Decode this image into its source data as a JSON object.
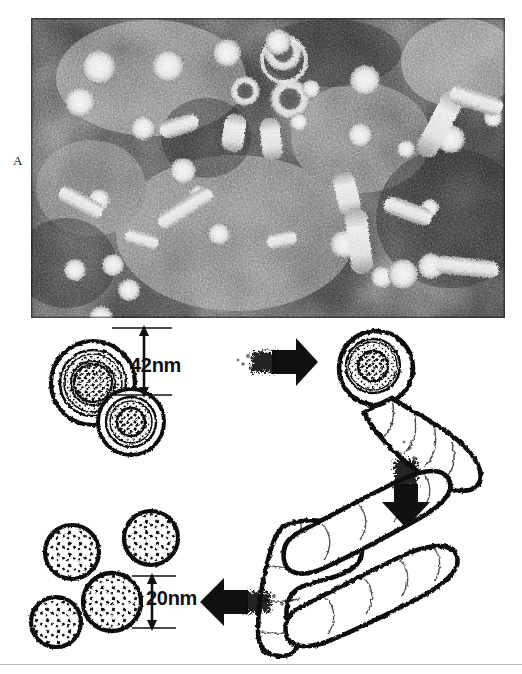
{
  "figure": {
    "type": "scientific-figure",
    "background_color": "#ffffff",
    "ink_color": "#111111"
  },
  "panels": {
    "a": {
      "label": "A",
      "kind": "electron-micrograph",
      "caption": "",
      "frame": {
        "x": 31,
        "y": 18,
        "width": 474,
        "height": 300
      },
      "tone": {
        "background": "#2b2b2b",
        "particles": "#f2f2f2"
      }
    },
    "b": {
      "label": "B",
      "kind": "schematic-diagram",
      "frame": {
        "x": 0,
        "y": 320,
        "width": 522,
        "height": 345
      }
    }
  },
  "measurements": [
    {
      "id": "dane-diameter",
      "value": "42nm",
      "refers_to": "complete virion (Dane particle)"
    },
    {
      "id": "sphere-diameter",
      "value": "20nm",
      "refers_to": "small spherical surface antigen particle"
    }
  ],
  "diagram_elements": {
    "dane_particles": {
      "name": "dane-particle",
      "count": 2,
      "description": "double-shelled spherical virion with dense granular core"
    },
    "tadpole_particle": {
      "name": "tadpole-particle",
      "count": 1,
      "description": "round head with segmented filamentous tail"
    },
    "filaments": {
      "name": "filamentous-particle",
      "count": 3,
      "description": "elongated segmented tubular surface-antigen filaments"
    },
    "small_spheres": {
      "name": "small-spherical-particle",
      "count": 4,
      "description": "small speckled spherical surface-antigen particles"
    },
    "arrows": [
      {
        "name": "arrow-right",
        "direction": "right"
      },
      {
        "name": "arrow-down",
        "direction": "down"
      },
      {
        "name": "arrow-left",
        "direction": "left"
      }
    ]
  },
  "footer": {
    "rule_color": "#b9b9bd"
  }
}
